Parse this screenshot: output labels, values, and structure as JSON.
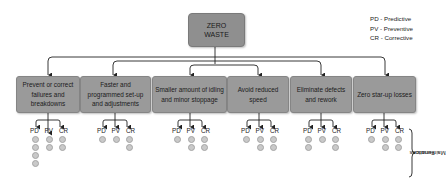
{
  "root": {
    "line1": "ZERO",
    "line2": "WASTE"
  },
  "legend": [
    {
      "label": "PD - Predictive"
    },
    {
      "label": "PV - Preventive"
    },
    {
      "label": "CR - Corrective"
    }
  ],
  "categories": [
    {
      "label": "Prevent or correct failures and breakdowns",
      "dots": {
        "PD": 4,
        "PV": 2,
        "CR": 2
      }
    },
    {
      "label": "Faster and programmed set-up and adjustments",
      "dots": {
        "PD": 1,
        "PV": 1,
        "CR": 2
      }
    },
    {
      "label": "Smaller amount of idling and minor stoppage",
      "dots": {
        "PD": 1,
        "PV": 2,
        "CR": 2
      }
    },
    {
      "label": "Avoid reduced speed",
      "dots": {
        "PD": 1,
        "PV": 2,
        "CR": 2
      }
    },
    {
      "label": "Eliminate defects and rework",
      "dots": {
        "PD": 2,
        "PV": 1,
        "CR": 2
      }
    },
    {
      "label": "Zero star-up losses",
      "dots": {
        "PD": 1,
        "PV": 2,
        "CR": 2
      }
    }
  ],
  "function_labels": {
    "pd": "PD",
    "pv": "PV",
    "cr": "CR"
  },
  "side_label": {
    "line1": "Maintenance",
    "line2": "Functions"
  },
  "colors": {
    "box_fill": "#9a9a9a",
    "root_fill": "#8f8f8f",
    "dot_fill": "#c9c9c9",
    "line": "#222222"
  }
}
